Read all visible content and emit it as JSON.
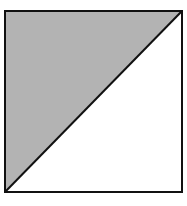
{
  "diagram": {
    "shape": "square-divided-by-diagonal",
    "square": {
      "x": 4,
      "y": 10,
      "size": 179
    },
    "diagonal": {
      "from": "bottom-left",
      "to": "top-right"
    },
    "shaded_region": "upper-left-triangle",
    "colors": {
      "shaded_fill": "#b3b3b3",
      "unshaded_fill": "#ffffff",
      "stroke": "#111111"
    }
  }
}
